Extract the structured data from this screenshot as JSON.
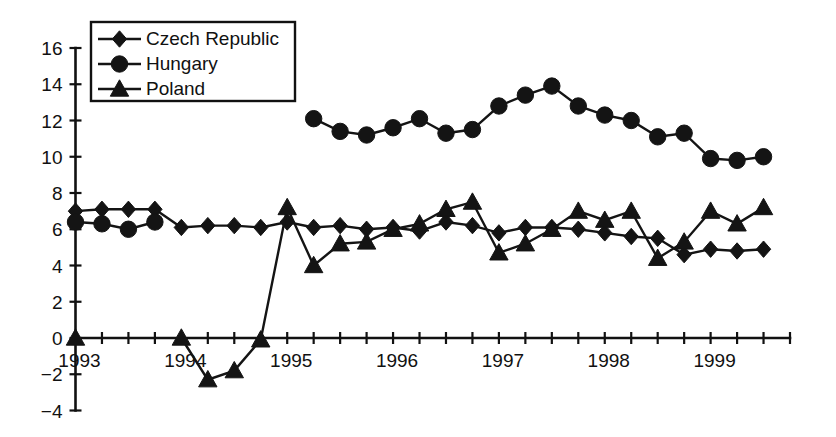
{
  "chart_data": {
    "type": "line",
    "title": "",
    "subtitle": "",
    "xlabel": "",
    "ylabel": "",
    "xlim": [
      1993.0,
      1999.75
    ],
    "ylim": [
      -4,
      16
    ],
    "yticks": [
      -4,
      -2,
      0,
      2,
      4,
      6,
      8,
      10,
      12,
      14,
      16
    ],
    "ytick_labels": [
      "−4",
      "−2",
      "0",
      "2",
      "4",
      "6",
      "8",
      "10",
      "12",
      "14",
      "16"
    ],
    "xticks": [
      1993,
      1994,
      1995,
      1996,
      1997,
      1998,
      1999
    ],
    "xtick_labels": [
      "1993",
      "1994",
      "1995",
      "1996",
      "1997",
      "1998",
      "1999"
    ],
    "x_minor_interval": 0.25,
    "grid": false,
    "legend_position": "top-left",
    "series": [
      {
        "name": "Czech Republic",
        "marker": "diamond",
        "x": [
          1993.0,
          1993.25,
          1993.5,
          1993.75,
          1994.0,
          1994.25,
          1994.5,
          1994.75,
          1995.0,
          1995.25,
          1995.5,
          1995.75,
          1996.0,
          1996.25,
          1996.5,
          1996.75,
          1997.0,
          1997.25,
          1997.5,
          1997.75,
          1998.0,
          1998.25,
          1998.5,
          1998.75,
          1999.0,
          1999.25,
          1999.5
        ],
        "values": [
          7.0,
          7.1,
          7.1,
          7.1,
          6.1,
          6.2,
          6.2,
          6.1,
          6.4,
          6.1,
          6.2,
          6.0,
          6.1,
          5.9,
          6.4,
          6.2,
          5.8,
          6.1,
          6.1,
          6.0,
          5.8,
          5.6,
          5.5,
          4.6,
          4.9,
          4.8,
          4.9
        ]
      },
      {
        "name": "Hungary",
        "marker": "circle",
        "x": [
          1993.0,
          1993.25,
          1993.5,
          1993.75,
          1995.25,
          1995.5,
          1995.75,
          1996.0,
          1996.25,
          1996.5,
          1996.75,
          1997.0,
          1997.25,
          1997.5,
          1997.75,
          1998.0,
          1998.25,
          1998.5,
          1998.75,
          1999.0,
          1999.25,
          1999.5
        ],
        "values": [
          6.4,
          6.3,
          6.0,
          6.4,
          12.1,
          11.4,
          11.2,
          11.6,
          12.1,
          11.3,
          11.5,
          12.8,
          13.4,
          13.9,
          12.8,
          12.3,
          12.0,
          11.1,
          11.3,
          9.9,
          9.8,
          10.0
        ]
      },
      {
        "name": "Poland",
        "marker": "triangle",
        "x": [
          1993.0,
          1994.0,
          1994.25,
          1994.5,
          1994.75,
          1995.0,
          1995.25,
          1995.5,
          1995.75,
          1996.0,
          1996.25,
          1996.5,
          1996.75,
          1997.0,
          1997.25,
          1997.5,
          1997.75,
          1998.0,
          1998.25,
          1998.5,
          1998.75,
          1999.0,
          1999.25,
          1999.5
        ],
        "values": [
          0.0,
          0.0,
          -2.3,
          -1.8,
          -0.1,
          7.2,
          4.0,
          5.2,
          5.3,
          6.0,
          6.3,
          7.1,
          7.5,
          4.7,
          5.2,
          6.0,
          7.0,
          6.5,
          7.0,
          4.4,
          5.3,
          7.0,
          6.3,
          7.2
        ]
      }
    ],
    "legend": [
      {
        "label": "Czech Republic",
        "marker": "diamond"
      },
      {
        "label": "Hungary",
        "marker": "circle"
      },
      {
        "label": "Poland",
        "marker": "triangle"
      }
    ],
    "colors": {
      "series": "#141414",
      "axis": "#111111",
      "background": "#ffffff"
    }
  }
}
